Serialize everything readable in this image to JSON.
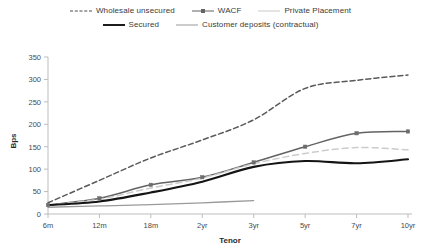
{
  "legend": {
    "rows": [
      [
        {
          "label": "Wholesale unsecured",
          "style": "dashed",
          "icon": "legend-line-dashed"
        },
        {
          "label": "WACF",
          "style": "solid-marker",
          "icon": "legend-line-solid-marker"
        },
        {
          "label": "Private Placement",
          "style": "light-dashed",
          "icon": "legend-line-light"
        }
      ],
      [
        {
          "label": "Secured",
          "style": "bold",
          "icon": "legend-line-bold"
        },
        {
          "label": "Customer deposits (contractual)",
          "style": "thin",
          "icon": "legend-line-thin"
        }
      ]
    ]
  },
  "axes": {
    "y_title": "Bps",
    "x_title": "Tenor",
    "y_ticks": [
      "0",
      "50",
      "100",
      "150",
      "200",
      "250",
      "300",
      "350"
    ],
    "x_ticks": [
      "6m",
      "12m",
      "18m",
      "2yr",
      "3yr",
      "5yr",
      "7yr",
      "10yr"
    ]
  },
  "colors": {
    "wholesale": "#5a5a5a",
    "wacf": "#636363",
    "private": "#cccccc",
    "secured": "#141414",
    "deposits": "#9a9a9a",
    "axis": "#bdbdbd",
    "text": "#3a3a3a"
  },
  "chart_data": {
    "type": "line",
    "title": "",
    "xlabel": "Tenor",
    "ylabel": "Bps",
    "categories": [
      "6m",
      "12m",
      "18m",
      "2yr",
      "3yr",
      "5yr",
      "7yr",
      "10yr"
    ],
    "ylim": [
      0,
      350
    ],
    "grid": false,
    "legend_position": "top",
    "series": [
      {
        "name": "Wholesale unsecured",
        "style": "dashed",
        "markers": false,
        "values": [
          25,
          75,
          125,
          165,
          210,
          280,
          298,
          310
        ]
      },
      {
        "name": "WACF",
        "style": "solid",
        "markers": true,
        "values": [
          20,
          35,
          65,
          82,
          115,
          150,
          180,
          184
        ]
      },
      {
        "name": "Private Placement",
        "style": "light-dashed",
        "markers": false,
        "values": [
          20,
          33,
          58,
          80,
          112,
          135,
          148,
          143
        ]
      },
      {
        "name": "Secured",
        "style": "bold",
        "markers": false,
        "values": [
          20,
          28,
          48,
          72,
          105,
          118,
          113,
          122
        ]
      },
      {
        "name": "Customer deposits (contractual)",
        "style": "thin",
        "markers": false,
        "values": [
          15,
          18,
          21,
          25,
          30,
          null,
          null,
          null
        ]
      }
    ]
  }
}
